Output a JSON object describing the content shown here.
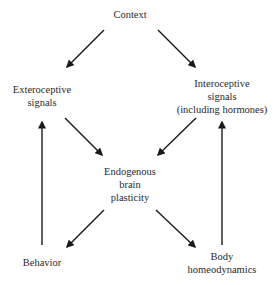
{
  "diagram": {
    "type": "flow-diagram",
    "nodes": {
      "context": {
        "lines": [
          "Context"
        ]
      },
      "exteroceptive": {
        "lines": [
          "Exteroceptive",
          "signals"
        ]
      },
      "interoceptive": {
        "lines": [
          "Interoceptive",
          "signals",
          "(including hormones)"
        ]
      },
      "endogenous": {
        "lines": [
          "Endogenous",
          "brain",
          "plasticity"
        ]
      },
      "behavior": {
        "lines": [
          "Behavior"
        ]
      },
      "body": {
        "lines": [
          "Body",
          "homeodynamics"
        ]
      }
    },
    "edges": [
      {
        "from": "Context",
        "to": "Exteroceptive signals"
      },
      {
        "from": "Context",
        "to": "Interoceptive signals (including hormones)"
      },
      {
        "from": "Exteroceptive signals",
        "to": "Endogenous brain plasticity"
      },
      {
        "from": "Interoceptive signals (including hormones)",
        "to": "Endogenous brain plasticity"
      },
      {
        "from": "Endogenous brain plasticity",
        "to": "Behavior"
      },
      {
        "from": "Endogenous brain plasticity",
        "to": "Body homeodynamics"
      },
      {
        "from": "Behavior",
        "to": "Exteroceptive signals"
      },
      {
        "from": "Body homeodynamics",
        "to": "Interoceptive signals (including hormones)"
      }
    ],
    "colors": {
      "arrow": "#1a1a1a",
      "text": "#2a2a2a",
      "background": "#ffffff"
    }
  }
}
